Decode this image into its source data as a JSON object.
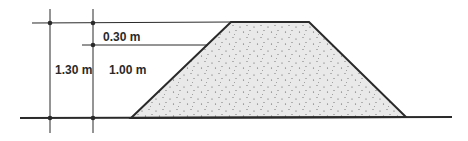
{
  "diagram": {
    "type": "embankment-cross-section",
    "labels": {
      "crest_height": "0.30 m",
      "total_height": "1.30 m",
      "body_height": "1.00 m"
    },
    "colors": {
      "line": "#2a2a2a",
      "fill": "#e9e9e9",
      "dots": "#555555"
    }
  }
}
